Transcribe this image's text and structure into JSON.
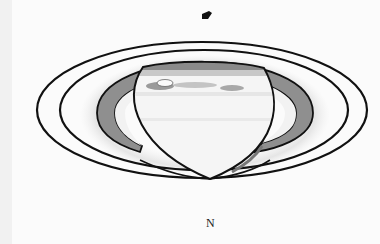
{
  "image": {
    "subject": "Drawing of Saturn with rings",
    "direction_label": "N",
    "colors": {
      "paper": "#fbfbfb",
      "ink": "#111111",
      "ring_shade": "#8a8a8a",
      "globe": "#f4f4f4"
    }
  }
}
